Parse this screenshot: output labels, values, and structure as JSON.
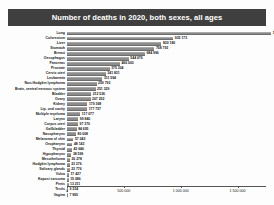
{
  "title": "Number of deaths in 2020, both sexes, all ages",
  "colors": {
    "banner_bg": "#3f3f3f",
    "banner_text": "#ffffff",
    "bar_fill": "#8c8c8c",
    "axis": "#555555",
    "page_bg": "#fdfdfd"
  },
  "chart_data": {
    "type": "bar",
    "orientation": "horizontal",
    "title": "Number of deaths in 2020, both sexes, all ages",
    "xlabel": "",
    "ylabel": "",
    "xlim": [
      0,
      1750000
    ],
    "grid": false,
    "legend": "none",
    "tick_labels": [
      "0",
      "500 000",
      "1 000 000",
      "1 500 000"
    ],
    "tick_values": [
      0,
      500000,
      1000000,
      1500000
    ],
    "categories": [
      "Lung",
      "Colorectum",
      "Liver",
      "Stomach",
      "Breast",
      "Oesophagus",
      "Pancreas",
      "Prostate",
      "Cervix uteri",
      "Leukaemia",
      "Non-Hodgkin lymphoma",
      "Brain, central nervous system",
      "Bladder",
      "Ovary",
      "Kidney",
      "Lip, oral cavity",
      "Multiple myeloma",
      "Larynx",
      "Corpus uteri",
      "Gallbladder",
      "Nasopharynx",
      "Melanoma of skin",
      "Oropharynx",
      "Thyroid",
      "Hypopharynx",
      "Mesothelioma",
      "Hodgkin lymphoma",
      "Salivary glands",
      "Vulva",
      "Kaposi sarcoma",
      "Penis",
      "Testis",
      "Vagina"
    ],
    "values": [
      1796144,
      935173,
      830180,
      768793,
      684996,
      544076,
      466003,
      375304,
      341831,
      311594,
      259793,
      251329,
      212536,
      207252,
      179368,
      177757,
      117077,
      99840,
      97370,
      84695,
      80008,
      57043,
      48143,
      43646,
      38599,
      26278,
      23376,
      23776,
      17427,
      15086,
      13211,
      9334,
      7995
    ],
    "value_labels": [
      "1 796 144",
      "935 173",
      "830 180",
      "768 793",
      "684 996",
      "544 076",
      "466 003",
      "375 304",
      "341 831",
      "311 594",
      "259 793",
      "251 329",
      "212 536",
      "207 252",
      "179 368",
      "177 757",
      "117 077",
      "99 840",
      "97 370",
      "84 695",
      "80 008",
      "57 043",
      "48 143",
      "43 646",
      "38 599",
      "26 278",
      "23 376",
      "23 776",
      "17 427",
      "15 086",
      "13 211",
      "9 334",
      "7 995"
    ]
  }
}
